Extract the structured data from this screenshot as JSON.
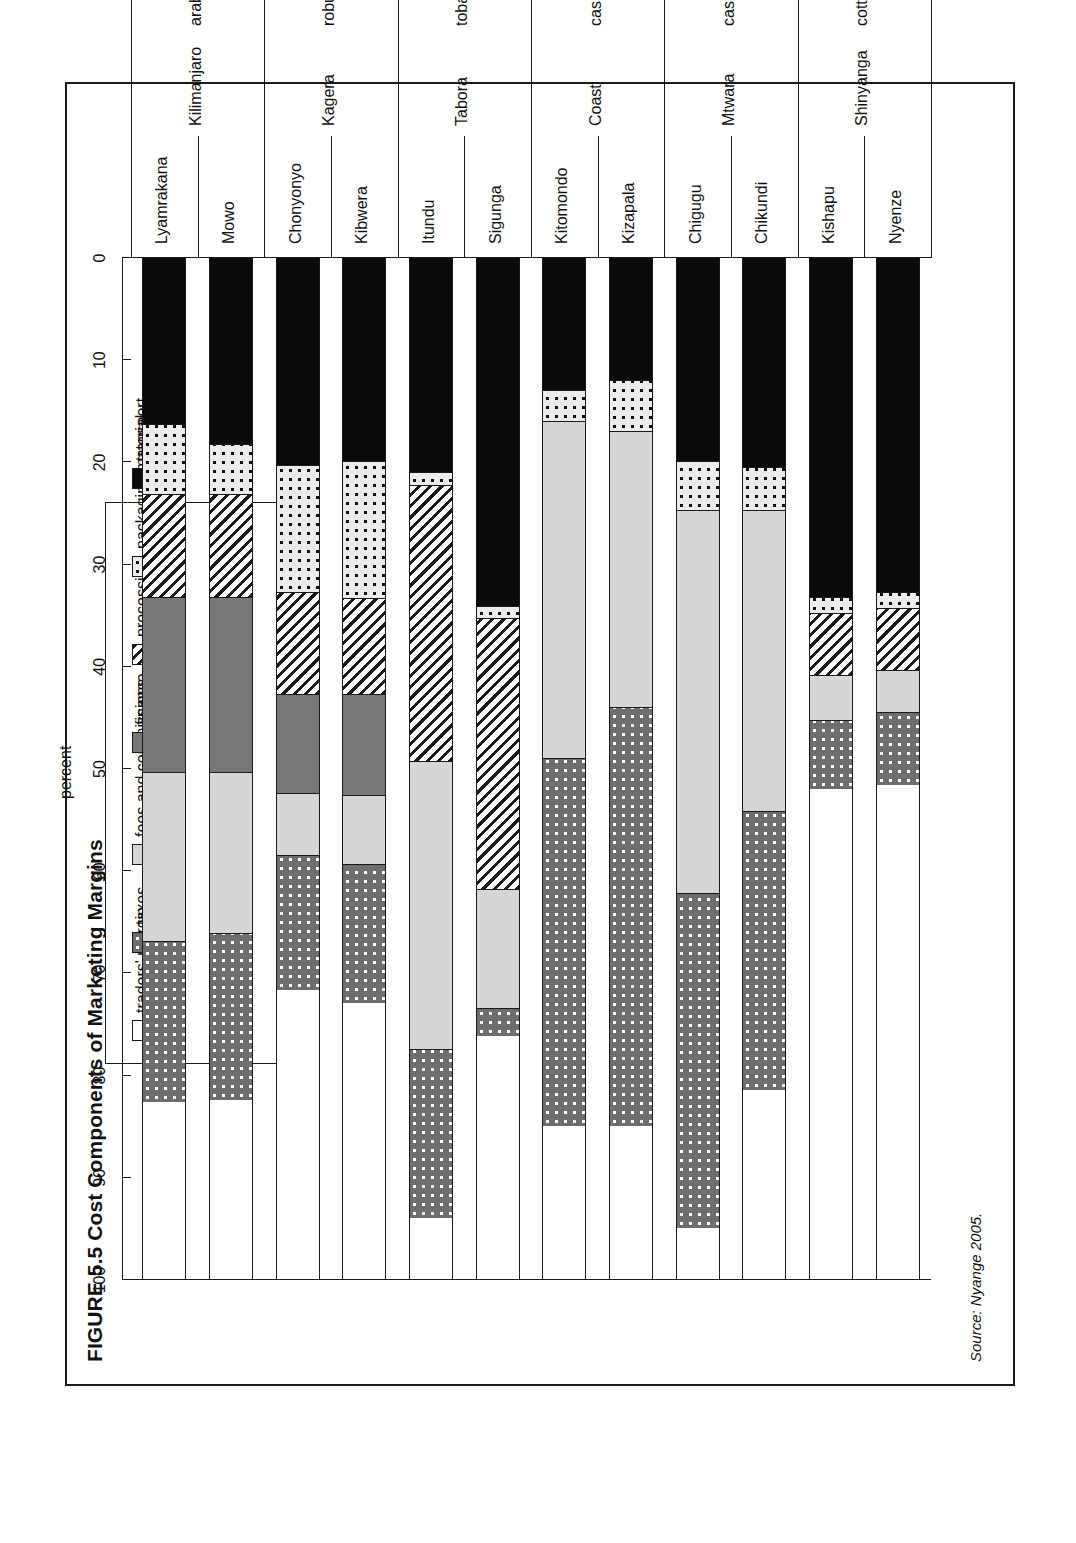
{
  "figure": {
    "title": "FIGURE 5.5 Cost Components of Marketing Margins",
    "source": "Source: Nyange 2005."
  },
  "legend": {
    "position": "top-left-inset",
    "items": [
      {
        "label": "traders' margin",
        "swatch": "white-empty"
      },
      {
        "label": "taxes",
        "swatch": "dark-gray-white-dots"
      },
      {
        "label": "fees and commissions",
        "swatch": "light-gray-solid"
      },
      {
        "label": "finance",
        "swatch": "medium-gray-solid"
      },
      {
        "label": "processing",
        "swatch": "diagonal-hatch"
      },
      {
        "label": "packaging material",
        "swatch": "light-gray-black-dots"
      },
      {
        "label": "transport",
        "swatch": "black-solid"
      }
    ]
  },
  "axis": {
    "value_axis_title": "percent",
    "value_ticks": [
      "100",
      "90",
      "80",
      "70",
      "60",
      "50",
      "40",
      "30",
      "20",
      "10",
      "0"
    ],
    "value_min": 0,
    "value_max": 100
  },
  "groups": [
    {
      "region": "Kilimanjaro",
      "crop": "arabica coffee",
      "sites": [
        "Lyamrakana",
        "Mowo"
      ]
    },
    {
      "region": "Kagera",
      "crop": "robusta coffee",
      "sites": [
        "Chonyonyo",
        "Kibwera"
      ]
    },
    {
      "region": "Tabora",
      "crop": "tobacco",
      "sites": [
        "Itundu",
        "Sigunga"
      ]
    },
    {
      "region": "Coast",
      "crop": "cashews",
      "sites": [
        "Kitomondo",
        "Kizapala"
      ]
    },
    {
      "region": "Mtwara",
      "crop": "cashews",
      "sites": [
        "Chigugu",
        "Chikundi"
      ]
    },
    {
      "region": "Shinyanga",
      "crop": "cotton",
      "sites": [
        "Kishapu",
        "Nyenze"
      ]
    }
  ],
  "chart_data": {
    "type": "bar",
    "orientation": "horizontal-stacked",
    "title": "FIGURE 5.5 Cost Components of Marketing Margins",
    "xlabel": "percent",
    "ylabel": "",
    "xlim": [
      0,
      100
    ],
    "grid": false,
    "legend_position": "inset-top",
    "stack_order_from_zero": [
      "transport",
      "packaging material",
      "processing",
      "finance",
      "fees and commissions",
      "taxes",
      "traders' margin"
    ],
    "categories": [
      "Lyamrakana",
      "Mowo",
      "Chonyonyo",
      "Kibwera",
      "Itundu",
      "Sigunga",
      "Kitomondo",
      "Kizapala",
      "Chigugu",
      "Chikundi",
      "Kishapu",
      "Nyenze"
    ],
    "series": [
      {
        "name": "transport",
        "values": [
          16.3,
          18.3,
          20.4,
          20.0,
          21.0,
          34.1,
          13.0,
          12.0,
          20.0,
          20.5,
          33.3,
          32.8
        ]
      },
      {
        "name": "packaging material",
        "values": [
          6.9,
          4.9,
          12.4,
          13.4,
          1.3,
          1.2,
          3.0,
          5.0,
          4.8,
          4.3,
          1.5,
          1.5
        ]
      },
      {
        "name": "processing",
        "values": [
          10.1,
          10.1,
          10.0,
          9.4,
          27.0,
          26.5,
          0.0,
          0.0,
          0.0,
          0.0,
          6.1,
          6.1
        ]
      },
      {
        "name": "finance",
        "values": [
          17.1,
          17.1,
          9.6,
          9.8,
          0.0,
          0.0,
          0.0,
          0.0,
          0.0,
          0.0,
          0.0,
          0.0
        ]
      },
      {
        "name": "fees and commissions",
        "values": [
          16.5,
          15.7,
          6.1,
          6.8,
          28.2,
          11.7,
          33.0,
          27.0,
          37.4,
          29.4,
          4.4,
          4.1
        ]
      },
      {
        "name": "taxes",
        "values": [
          15.8,
          16.4,
          13.2,
          13.6,
          16.5,
          2.7,
          36.0,
          41.0,
          32.8,
          27.3,
          6.8,
          7.2
        ]
      },
      {
        "name": "traders' margin",
        "values": [
          17.3,
          17.5,
          28.3,
          27.0,
          6.0,
          23.8,
          15.0,
          15.0,
          5.0,
          18.5,
          47.9,
          48.3
        ]
      }
    ]
  }
}
